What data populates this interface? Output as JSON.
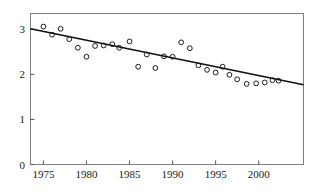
{
  "chart_data": {
    "type": "scatter",
    "title": "",
    "subtitle": "",
    "xlabel": "",
    "ylabel": "",
    "xlim": [
      1973.5,
      2005.2
    ],
    "ylim": [
      0,
      3.35
    ],
    "grid": false,
    "legend": "none",
    "xticks": [
      1975,
      1980,
      1985,
      1990,
      1995,
      2000
    ],
    "xtick_labels": [
      "1975",
      "1980",
      "1985",
      "1990",
      "1995",
      "2000"
    ],
    "yticks": [
      0,
      1,
      2,
      3
    ],
    "ytick_labels": [
      "0",
      "1",
      "2",
      "3"
    ],
    "series": [
      {
        "name": "observations",
        "marker": "open-circle",
        "x": [
          1975,
          1976,
          1977,
          1978,
          1979,
          1980,
          1981,
          1982,
          1983,
          1983.8,
          1985,
          1986,
          1987,
          1988,
          1989,
          1990,
          1991,
          1992,
          1993,
          1994,
          1995,
          1995.8,
          1996.6,
          1997.5,
          1998.6,
          1999.7,
          2000.7,
          2001.6,
          2002.3
        ],
        "y": [
          3.06,
          2.88,
          3.01,
          2.78,
          2.59,
          2.39,
          2.63,
          2.64,
          2.67,
          2.59,
          2.73,
          2.17,
          2.44,
          2.14,
          2.4,
          2.39,
          2.71,
          2.58,
          2.2,
          2.1,
          2.04,
          2.17,
          1.99,
          1.89,
          1.79,
          1.8,
          1.82,
          1.87,
          1.86
        ]
      },
      {
        "name": "trend-line",
        "type": "line",
        "x": [
          1973.5,
          2005.2
        ],
        "y": [
          3.01,
          1.77
        ]
      }
    ]
  },
  "axes": {
    "frame_color": "#808080",
    "tick_color": "#555555",
    "point_color": "#1a1a1a",
    "line_color": "#111111"
  }
}
